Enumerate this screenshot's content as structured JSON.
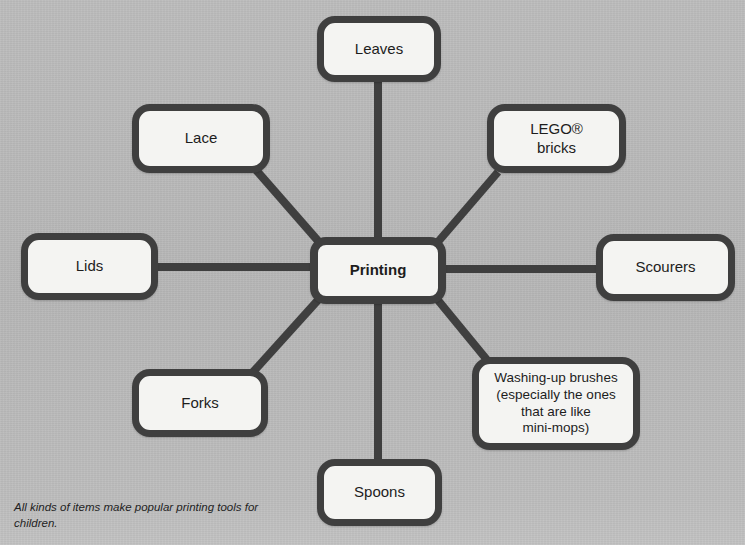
{
  "diagram": {
    "type": "mind-map",
    "background_color": "#b7b7b7",
    "node_fill_color": "#f4f4f2",
    "node_border_color": "#3f3f3f",
    "edge_color": "#3f3f3f",
    "central": {
      "label": "Printing",
      "x": 310,
      "y": 237,
      "w": 136,
      "h": 67
    },
    "nodes": [
      {
        "id": "leaves",
        "label": "Leaves",
        "x": 317,
        "y": 16,
        "w": 124,
        "h": 66,
        "font_size": 15
      },
      {
        "id": "lego",
        "label": "LEGO®\nbricks",
        "x": 487,
        "y": 104,
        "w": 139,
        "h": 69,
        "font_size": 15
      },
      {
        "id": "scourers",
        "label": "Scourers",
        "x": 596,
        "y": 234,
        "w": 139,
        "h": 67,
        "font_size": 15
      },
      {
        "id": "washing",
        "label": "Washing-up brushes\n(especially the ones\nthat are like\nmini-mops)",
        "x": 472,
        "y": 357,
        "w": 168,
        "h": 93,
        "font_size": 13.5
      },
      {
        "id": "spoons",
        "label": "Spoons",
        "x": 317,
        "y": 459,
        "w": 125,
        "h": 67,
        "font_size": 15
      },
      {
        "id": "forks",
        "label": "Forks",
        "x": 132,
        "y": 369,
        "w": 136,
        "h": 68,
        "font_size": 15
      },
      {
        "id": "lids",
        "label": "Lids",
        "x": 21,
        "y": 233,
        "w": 137,
        "h": 67,
        "font_size": 15
      },
      {
        "id": "lace",
        "label": "Lace",
        "x": 132,
        "y": 104,
        "w": 138,
        "h": 69,
        "font_size": 15
      }
    ],
    "edges": [
      {
        "from": "printing",
        "to": "leaves",
        "x1": 378,
        "y1": 237,
        "x2": 378,
        "y2": 82
      },
      {
        "from": "printing",
        "to": "lego",
        "x1": 437,
        "y1": 243,
        "x2": 498,
        "y2": 172
      },
      {
        "from": "printing",
        "to": "scourers",
        "x1": 446,
        "y1": 269,
        "x2": 596,
        "y2": 269
      },
      {
        "from": "printing",
        "to": "washing",
        "x1": 437,
        "y1": 299,
        "x2": 492,
        "y2": 366
      },
      {
        "from": "printing",
        "to": "spoons",
        "x1": 378,
        "y1": 304,
        "x2": 378,
        "y2": 459
      },
      {
        "from": "printing",
        "to": "forks",
        "x1": 319,
        "y1": 299,
        "x2": 253,
        "y2": 372
      },
      {
        "from": "printing",
        "to": "lids",
        "x1": 310,
        "y1": 267,
        "x2": 158,
        "y2": 267
      },
      {
        "from": "printing",
        "to": "lace",
        "x1": 319,
        "y1": 242,
        "x2": 256,
        "y2": 170
      }
    ]
  },
  "caption": {
    "text": "All kinds of items make popular printing tools for children."
  }
}
